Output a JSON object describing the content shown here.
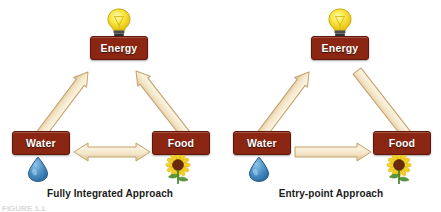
{
  "figure": {
    "background_color": "#ffffff",
    "clipped_caption": "FIGURE 1.1",
    "node_fill_color": "#8a2611",
    "node_border_color": "#5e1708",
    "node_text_color": "#ffffff",
    "arrow_fill_color": "#f2e3c4",
    "arrow_border_color": "#c9a876",
    "caption_text_color": "#1a1a1a"
  },
  "panels": [
    {
      "id": "fully-integrated",
      "caption": "Fully Integrated Approach",
      "nodes": {
        "energy": {
          "label": "Energy",
          "icon": "lightbulb-icon"
        },
        "water": {
          "label": "Water",
          "icon": "water-drop-icon"
        },
        "food": {
          "label": "Food",
          "icon": "sunflower-icon"
        }
      },
      "arrows": [
        {
          "from": "Energy",
          "to": "Water",
          "direction": "bidirectional"
        },
        {
          "from": "Energy",
          "to": "Food",
          "direction": "bidirectional"
        },
        {
          "from": "Water",
          "to": "Food",
          "direction": "bidirectional"
        }
      ]
    },
    {
      "id": "entry-point",
      "caption": "Entry-point Approach",
      "nodes": {
        "energy": {
          "label": "Energy",
          "icon": "lightbulb-icon"
        },
        "water": {
          "label": "Water",
          "icon": "water-drop-icon"
        },
        "food": {
          "label": "Food",
          "icon": "sunflower-icon"
        }
      },
      "arrows": [
        {
          "from": "Energy",
          "to": "Water",
          "direction": "unidirectional"
        },
        {
          "from": "Energy",
          "to": "Food",
          "direction": "unidirectional"
        },
        {
          "from": "Water",
          "to": "Food",
          "direction": "unidirectional"
        }
      ]
    }
  ]
}
